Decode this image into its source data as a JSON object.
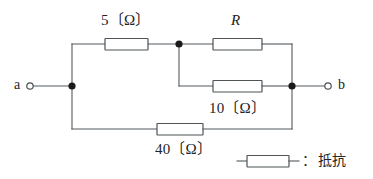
{
  "diagram": {
    "type": "electrical-circuit",
    "terminals": [
      {
        "id": "a",
        "label": "a",
        "x": 26,
        "y": 86,
        "style": "open-circle"
      },
      {
        "id": "b",
        "label": "b",
        "x": 338,
        "y": 86,
        "style": "open-circle"
      }
    ],
    "components": [
      {
        "id": "r5",
        "symbol": "resistor",
        "label": "5〔Ω〕",
        "value": 5,
        "unit": "Ω",
        "branch": "top-left"
      },
      {
        "id": "rR",
        "symbol": "resistor",
        "label": "R",
        "value": null,
        "unit": "",
        "branch": "parallel-upper"
      },
      {
        "id": "r10",
        "symbol": "resistor",
        "label": "10〔Ω〕",
        "value": 10,
        "unit": "Ω",
        "branch": "parallel-lower"
      },
      {
        "id": "r40",
        "symbol": "resistor",
        "label": "40〔Ω〕",
        "value": 40,
        "unit": "Ω",
        "branch": "bottom"
      }
    ],
    "junction_dots": [
      {
        "id": "node-left",
        "x": 72,
        "y": 86
      },
      {
        "id": "node-mid",
        "x": 179,
        "y": 44
      },
      {
        "id": "node-right",
        "x": 292,
        "y": 86
      }
    ],
    "labels": {
      "r5": "5〔Ω〕",
      "rR": "R",
      "r10": "10〔Ω〕",
      "r40": "40〔Ω〕",
      "terminal_a": "a",
      "terminal_b": "b"
    },
    "legend": {
      "separator": "：",
      "text": "抵抗",
      "symbol": "resistor"
    },
    "colors": {
      "wire": "#555a5e",
      "component_outline": "#4f5457",
      "node": "#1a1a1a",
      "text": "#222426",
      "background": "#ffffff"
    }
  }
}
